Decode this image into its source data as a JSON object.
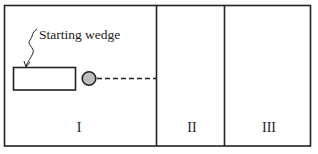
{
  "diagram": {
    "annotation_label": "Starting wedge",
    "regions": [
      {
        "id": "I",
        "label": "I"
      },
      {
        "id": "II",
        "label": "II"
      },
      {
        "id": "III",
        "label": "III"
      }
    ],
    "colors": {
      "stroke": "#222222",
      "ball_fill": "#bdbdbd",
      "background": "#ffffff"
    }
  }
}
